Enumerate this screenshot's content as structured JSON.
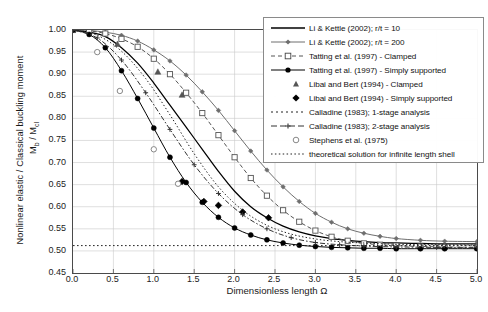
{
  "chart_data": {
    "type": "line",
    "title": "",
    "xlabel": "Dimensionless length Ω",
    "ylabel": "Nonlinear elastic / Classical buckling moment",
    "ylabel_unit": "Mb / Mcl",
    "xlim": [
      0.0,
      5.0
    ],
    "ylim": [
      0.45,
      1.0
    ],
    "xticks": [
      "0.0",
      "0.5",
      "1.0",
      "1.5",
      "2.0",
      "2.5",
      "3.0",
      "3.5",
      "4.0",
      "4.5",
      "5.0"
    ],
    "yticks": [
      "1.00",
      "0.95",
      "0.90",
      "0.85",
      "0.80",
      "0.75",
      "0.70",
      "0.65",
      "0.60",
      "0.55",
      "0.50",
      "0.45"
    ],
    "grid": true,
    "legend_position": "top-right",
    "asymptote": 0.512,
    "series": [
      {
        "name": "Li & Kettle (2002); r/t = 10",
        "style": "solid-line",
        "color": "#000000",
        "marker": "none",
        "x": [
          0.0,
          0.2,
          0.4,
          0.6,
          0.8,
          1.0,
          1.2,
          1.4,
          1.6,
          1.8,
          2.0,
          2.2,
          2.4,
          2.6,
          2.8,
          3.0,
          3.2,
          3.4,
          3.6,
          3.8,
          4.0,
          4.3,
          4.6,
          5.0
        ],
        "y": [
          1.0,
          0.995,
          0.985,
          0.96,
          0.925,
          0.88,
          0.83,
          0.78,
          0.73,
          0.68,
          0.635,
          0.6,
          0.575,
          0.556,
          0.543,
          0.534,
          0.528,
          0.524,
          0.521,
          0.519,
          0.518,
          0.517,
          0.516,
          0.516
        ]
      },
      {
        "name": "Li & Kettle (2002); r/t = 200",
        "style": "line-marker",
        "color": "#6e6e6e",
        "marker": "diamond-small",
        "x": [
          0.0,
          0.2,
          0.4,
          0.6,
          0.8,
          1.0,
          1.2,
          1.4,
          1.6,
          1.8,
          2.0,
          2.2,
          2.4,
          2.6,
          2.8,
          3.0,
          3.2,
          3.4,
          3.6,
          3.8,
          4.0,
          4.3,
          4.6,
          5.0
        ],
        "y": [
          1.0,
          0.999,
          0.995,
          0.988,
          0.975,
          0.955,
          0.93,
          0.898,
          0.86,
          0.818,
          0.772,
          0.726,
          0.683,
          0.645,
          0.612,
          0.585,
          0.565,
          0.55,
          0.54,
          0.533,
          0.528,
          0.524,
          0.522,
          0.521
        ]
      },
      {
        "name": "Tatting et al. (1997) - Clamped",
        "style": "dashed-marker",
        "color": "#555555",
        "marker": "square-open",
        "x": [
          0.0,
          0.2,
          0.4,
          0.6,
          0.8,
          1.0,
          1.2,
          1.4,
          1.6,
          1.8,
          2.0,
          2.2,
          2.4,
          2.6,
          2.8,
          3.0,
          3.2,
          3.4,
          3.6,
          3.8,
          4.0,
          4.3,
          4.6,
          5.0
        ],
        "y": [
          1.0,
          0.998,
          0.992,
          0.98,
          0.962,
          0.935,
          0.9,
          0.858,
          0.812,
          0.762,
          0.712,
          0.665,
          0.625,
          0.592,
          0.566,
          0.546,
          0.532,
          0.523,
          0.517,
          0.514,
          0.512,
          0.51,
          0.509,
          0.508
        ]
      },
      {
        "name": "Tatting et al. (1997) - Simply supported",
        "style": "line-marker",
        "color": "#000000",
        "marker": "circle-filled",
        "x": [
          0.0,
          0.2,
          0.4,
          0.6,
          0.8,
          1.0,
          1.2,
          1.4,
          1.6,
          1.8,
          2.0,
          2.2,
          2.4,
          2.6,
          2.8,
          3.0,
          3.2,
          3.4,
          3.6,
          3.8,
          4.0,
          4.3,
          4.6,
          5.0
        ],
        "y": [
          1.0,
          0.99,
          0.96,
          0.908,
          0.845,
          0.778,
          0.712,
          0.655,
          0.61,
          0.576,
          0.552,
          0.536,
          0.525,
          0.518,
          0.513,
          0.51,
          0.508,
          0.507,
          0.506,
          0.506,
          0.505,
          0.505,
          0.505,
          0.505
        ]
      },
      {
        "name": "Libai and Bert (1994) - Clamped",
        "style": "marker-only",
        "color": "#555555",
        "marker": "triangle-filled",
        "x": [
          0.55,
          1.05,
          1.35
        ],
        "y": [
          0.968,
          0.905,
          0.853
        ]
      },
      {
        "name": "Libai and Bert (1994) - Simply supported",
        "style": "marker-only",
        "color": "#000000",
        "marker": "diamond-filled",
        "x": [
          1.35,
          1.62,
          1.8,
          2.1,
          2.42
        ],
        "y": [
          0.657,
          0.612,
          0.603,
          0.588,
          0.575
        ]
      },
      {
        "name": "Calladine (1983); 1-stage analysis",
        "style": "fine-dotted",
        "color": "#222222",
        "marker": "none",
        "x": [
          0.0,
          0.3,
          0.6,
          0.9,
          1.2,
          1.5,
          1.8,
          2.1,
          2.4,
          2.7,
          3.0,
          3.3,
          3.6,
          4.0,
          4.5,
          5.0
        ],
        "y": [
          1.0,
          0.988,
          0.952,
          0.89,
          0.808,
          0.72,
          0.645,
          0.592,
          0.558,
          0.538,
          0.527,
          0.521,
          0.518,
          0.515,
          0.514,
          0.513
        ]
      },
      {
        "name": "Calladine (1983); 2-stage analysis",
        "style": "dash-dot",
        "color": "#333333",
        "marker": "plus-small",
        "x": [
          0.0,
          0.3,
          0.6,
          0.9,
          1.2,
          1.5,
          1.8,
          2.1,
          2.4,
          2.7,
          3.0,
          3.3,
          3.6,
          4.0,
          4.5,
          5.0
        ],
        "y": [
          1.0,
          0.982,
          0.932,
          0.858,
          0.775,
          0.695,
          0.63,
          0.582,
          0.55,
          0.53,
          0.519,
          0.514,
          0.511,
          0.509,
          0.508,
          0.508
        ]
      },
      {
        "name": "Stephens et al. (1975)",
        "style": "marker-only",
        "color": "#7a7a7a",
        "marker": "circle-open",
        "x": [
          0.3,
          0.58,
          1.0,
          1.3
        ],
        "y": [
          0.95,
          0.862,
          0.73,
          0.652
        ]
      },
      {
        "name": "theoretical solution for infinite length shell",
        "style": "dotted-horizontal",
        "color": "#222222",
        "marker": "none",
        "x": [
          0.0,
          5.0
        ],
        "y": [
          0.512,
          0.512
        ]
      }
    ]
  },
  "legend": {
    "items": [
      {
        "label": "Li & Kettle (2002); r/t = 10",
        "sym": "solid-line"
      },
      {
        "label": "Li & Kettle (2002); r/t = 200",
        "sym": "line-diamond"
      },
      {
        "label": "Tatting et al. (1997) - Clamped",
        "sym": "dash-square-open"
      },
      {
        "label": "Tatting et al. (1997) - Simply supported",
        "sym": "line-circle-filled"
      },
      {
        "label": "Libai and Bert (1994) - Clamped",
        "sym": "triangle-filled"
      },
      {
        "label": "Libai and Bert (1994) - Simply supported",
        "sym": "diamond-filled"
      },
      {
        "label": "Calladine (1983); 1-stage analysis",
        "sym": "fine-dotted"
      },
      {
        "label": "Calladine (1983); 2-stage analysis",
        "sym": "dash-plus"
      },
      {
        "label": "Stephens et al. (1975)",
        "sym": "circle-open"
      },
      {
        "label": "theoretical solution for infinite length shell",
        "sym": "dotted"
      }
    ]
  }
}
